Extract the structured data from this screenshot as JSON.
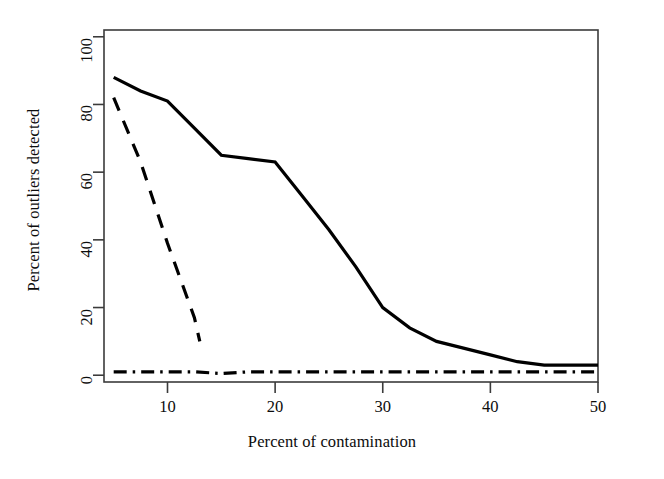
{
  "chart_data": {
    "type": "line",
    "title": "",
    "xlabel": "Percent of contamination",
    "ylabel": "Percent of outliers detected",
    "xlim": [
      4.1,
      50
    ],
    "ylim": [
      -2,
      102
    ],
    "xticks": [
      10,
      20,
      30,
      40,
      50
    ],
    "yticks": [
      0,
      20,
      40,
      60,
      80,
      100
    ],
    "xtick_labels": [
      "10",
      "20",
      "30",
      "40",
      "50"
    ],
    "ytick_labels": [
      "0",
      "20",
      "40",
      "60",
      "80",
      "100"
    ],
    "grid": false,
    "legend": "none",
    "box": true,
    "series": [
      {
        "name": "solid",
        "style": "solid",
        "color": "#000000",
        "width": 3.2,
        "x": [
          5,
          7.5,
          10,
          12.5,
          15,
          17.5,
          20,
          22.5,
          25,
          27.5,
          30,
          32.5,
          35,
          37.5,
          40,
          42.5,
          45,
          47.5,
          50
        ],
        "y": [
          88,
          84,
          81,
          73,
          65,
          64,
          63,
          53,
          43,
          32,
          20,
          14,
          10,
          8,
          6,
          4,
          3,
          3,
          3
        ]
      },
      {
        "name": "dashed",
        "style": "dashed",
        "color": "#000000",
        "width": 3.2,
        "x": [
          5,
          7.5,
          10,
          12.5,
          13
        ],
        "y": [
          82,
          63,
          39,
          17,
          10
        ]
      },
      {
        "name": "dot-dash",
        "style": "dashdot",
        "color": "#000000",
        "width": 3.2,
        "x": [
          5,
          7.5,
          10,
          12.5,
          15,
          17.5,
          20,
          22.5,
          25,
          27.5,
          30,
          32.5,
          35,
          37.5,
          40,
          42.5,
          45,
          47.5,
          50
        ],
        "y": [
          1,
          1,
          1,
          1,
          0.5,
          1,
          1,
          1,
          1,
          1,
          1,
          1,
          1,
          1,
          1,
          1,
          1,
          1,
          1
        ]
      }
    ]
  }
}
